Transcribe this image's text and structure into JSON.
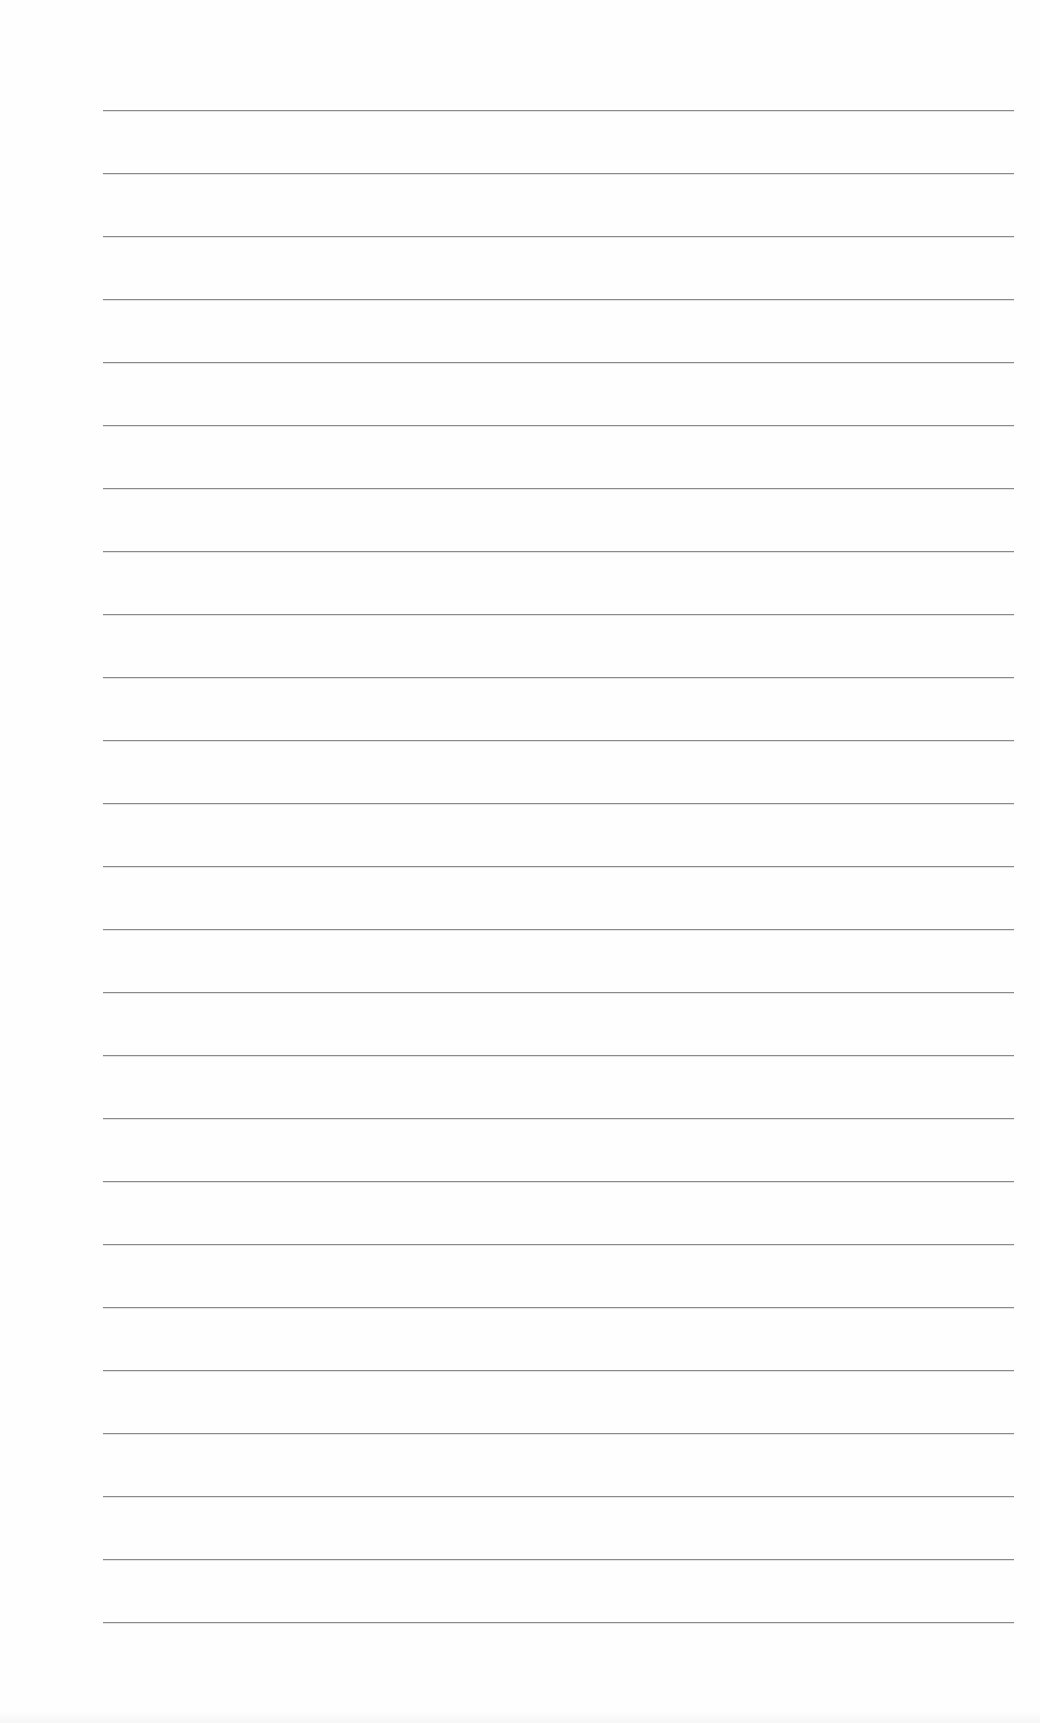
{
  "document": {
    "type": "lined-paper",
    "line_count": 25,
    "first_line_y": 110,
    "line_spacing": 63,
    "line_left": 103,
    "line_right": 1014,
    "line_color": "#8a8a8a",
    "background_color": "#ffffff"
  }
}
